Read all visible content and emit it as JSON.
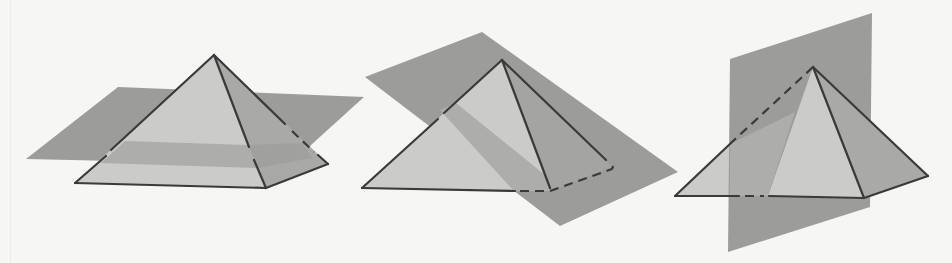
{
  "figure": {
    "colors": {
      "background": "#f6f6f4",
      "front_face": "#cbcbca",
      "side_face": "#a9a9a8",
      "plane": "#9c9c9b",
      "plane_through_face": "#adadac",
      "edge": "#3a3a3a"
    },
    "panels": [
      {
        "id": "horizontal",
        "label": "Pyramid cut by a horizontal plane"
      },
      {
        "id": "oblique",
        "label": "Pyramid cut by an oblique plane"
      },
      {
        "id": "vertical",
        "label": "Pyramid cut by a vertical plane"
      }
    ]
  }
}
